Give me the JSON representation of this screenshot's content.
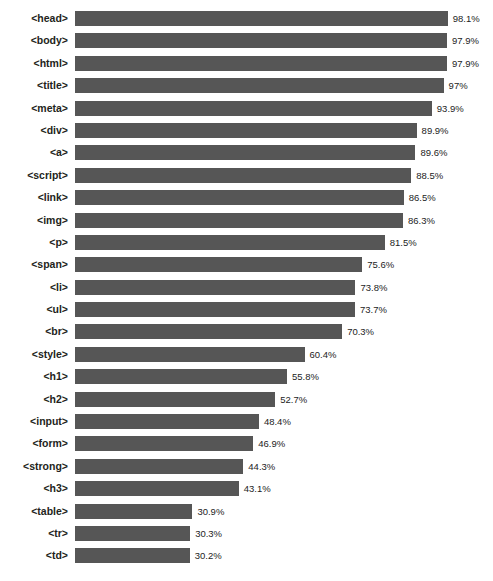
{
  "chart_data": {
    "type": "bar",
    "orientation": "horizontal",
    "title": "",
    "xlabel": "",
    "ylabel": "",
    "xlim": [
      0,
      100
    ],
    "grid": false,
    "legend": null,
    "value_suffix": "%",
    "categories": [
      "<head>",
      "<body>",
      "<html>",
      "<title>",
      "<meta>",
      "<div>",
      "<a>",
      "<script>",
      "<link>",
      "<img>",
      "<p>",
      "<span>",
      "<li>",
      "<ul>",
      "<br>",
      "<style>",
      "<h1>",
      "<h2>",
      "<input>",
      "<form>",
      "<strong>",
      "<h3>",
      "<table>",
      "<tr>",
      "<td>"
    ],
    "values": [
      98.1,
      97.9,
      97.9,
      97.0,
      93.9,
      89.9,
      89.6,
      88.5,
      86.5,
      86.3,
      81.5,
      75.6,
      73.8,
      73.7,
      70.3,
      60.4,
      55.8,
      52.7,
      48.4,
      46.9,
      44.3,
      43.1,
      30.9,
      30.3,
      30.2
    ],
    "value_labels": [
      "98.1%",
      "97.9%",
      "97.9%",
      "97%",
      "93.9%",
      "89.9%",
      "89.6%",
      "88.5%",
      "86.5%",
      "86.3%",
      "81.5%",
      "75.6%",
      "73.8%",
      "73.7%",
      "70.3%",
      "60.4%",
      "55.8%",
      "52.7%",
      "48.4%",
      "46.9%",
      "44.3%",
      "43.1%",
      "30.9%",
      "30.3%",
      "30.2%"
    ],
    "bar_color": "#565656",
    "axis_max_for_layout": 110
  }
}
